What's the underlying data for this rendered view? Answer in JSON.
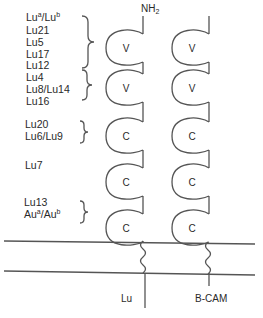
{
  "terminus": {
    "label": "NH",
    "subscript": "2"
  },
  "proteins": [
    {
      "name": "Lu"
    },
    {
      "name": "B-CAM"
    }
  ],
  "domains": [
    {
      "type": "V"
    },
    {
      "type": "V"
    },
    {
      "type": "C"
    },
    {
      "type": "C"
    },
    {
      "type": "C"
    }
  ],
  "antigen_groups": [
    {
      "domain_index": 0,
      "antigens": [
        "Lu^a/Lu^b",
        "Lu21",
        "Lu5",
        "Lu17",
        "Lu12"
      ]
    },
    {
      "domain_index": 1,
      "antigens": [
        "Lu4",
        "Lu8/Lu14",
        "Lu16"
      ]
    },
    {
      "domain_index": 2,
      "antigens": [
        "Lu20",
        "Lu6/Lu9"
      ]
    },
    {
      "domain_index": 3,
      "antigens": [
        "Lu7"
      ]
    },
    {
      "domain_index": 4,
      "antigens": [
        "Lu13",
        "Au^a/Au^b"
      ]
    }
  ],
  "labels": {
    "a1_base": "Lu",
    "a1_sup": "a",
    "a1_sep": "/Lu",
    "a1_sup2": "b",
    "a2": "Lu21",
    "a3": "Lu5",
    "a4": "Lu17",
    "a5": "Lu12",
    "b1": "Lu4",
    "b2": "Lu8/Lu14",
    "b3": "Lu16",
    "c1": "Lu20",
    "c2": "Lu6/Lu9",
    "d1": "Lu7",
    "e1": "Lu13",
    "e2_base": "Au",
    "e2_sup": "a",
    "e2_sep": "/Au",
    "e2_sup2": "b"
  },
  "colors": {
    "line": "#4a4a4a",
    "text": "#2a2a2a",
    "background": "#ffffff"
  }
}
